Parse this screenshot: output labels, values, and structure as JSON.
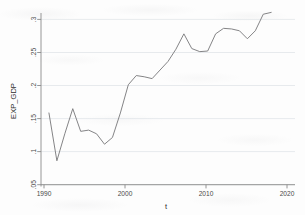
{
  "chart_data": {
    "type": "line",
    "title": "",
    "xlabel": "t",
    "ylabel": "EXP_GDP",
    "xlim": [
      1989.0,
      2021.0
    ],
    "ylim": [
      0.035,
      0.315
    ],
    "grid": true,
    "grid_orientation": "horizontal",
    "legend": "none",
    "line_color": "#7d7d80",
    "axis_color": "#8a8a8a",
    "grid_color": "#d8dde2",
    "background_color": "#fdfdfd",
    "xticks": [
      1990,
      2000,
      2010,
      2020
    ],
    "xticklabels": [
      "1990",
      "2000",
      "2010",
      "2020"
    ],
    "yticks": [
      0.05,
      0.1,
      0.15,
      0.2,
      0.25,
      0.3
    ],
    "yticklabels": [
      ".05",
      ".1",
      ".15",
      ".2",
      ".25",
      ".3"
    ],
    "series": [
      {
        "name": "EXP_GDP",
        "x": [
          1990,
          1991,
          1992,
          1993,
          1994,
          1995,
          1996,
          1997,
          1998,
          1999,
          2000,
          2001,
          2002,
          2003,
          2004,
          2005,
          2006,
          2007,
          2008,
          2009,
          2010,
          2011,
          2012,
          2013,
          2014,
          2015,
          2016,
          2017,
          2018
        ],
        "y": [
          0.152,
          0.074,
          0.118,
          0.159,
          0.122,
          0.124,
          0.118,
          0.101,
          0.112,
          0.152,
          0.198,
          0.213,
          0.211,
          0.208,
          0.222,
          0.236,
          0.256,
          0.281,
          0.257,
          0.252,
          0.253,
          0.281,
          0.29,
          0.289,
          0.286,
          0.273,
          0.286,
          0.313,
          0.316
        ]
      }
    ]
  },
  "axes": {
    "x_title": "t",
    "y_title": "EXP_GDP"
  }
}
